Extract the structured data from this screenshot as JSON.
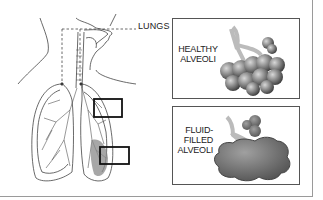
{
  "diagram": {
    "callout_label": "LUNGS",
    "panels": [
      {
        "id": "healthy",
        "label_lines": [
          "HEALTHY",
          "ALVEOLI"
        ]
      },
      {
        "id": "fluid",
        "label_lines": [
          "FLUID-",
          "FILLED",
          "ALVEOLI"
        ]
      }
    ],
    "colors": {
      "line": "#333333",
      "panel_border": "#555555",
      "frame_border": "#9a9a9a",
      "fluid_shade": "#8a8a8a"
    }
  }
}
